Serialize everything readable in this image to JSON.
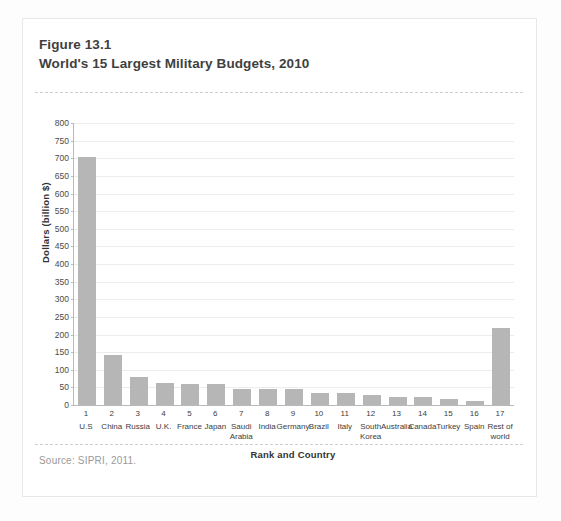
{
  "figure": {
    "number": "Figure 13.1",
    "title": "World's 15 Largest Military Budgets, 2010",
    "source": "Source: SIPRI, 2011."
  },
  "chart_data": {
    "type": "bar",
    "title": "World's 15 Largest Military Budgets, 2010",
    "xlabel": "Rank and Country",
    "ylabel": "Dollars (billion $)",
    "ylim": [
      0,
      800
    ],
    "ytick_step": 50,
    "yticks": [
      0,
      50,
      100,
      150,
      200,
      250,
      300,
      350,
      400,
      450,
      500,
      550,
      600,
      650,
      700,
      750,
      800
    ],
    "ytick_labels": [
      "0",
      "50",
      "100",
      "150",
      "200",
      "250",
      "300",
      "350",
      "400",
      "450",
      "500",
      "550",
      "600",
      "650",
      "700",
      "750",
      "800"
    ],
    "grid": true,
    "legend": null,
    "bar_color": "#b6b6b6",
    "ranks": [
      "1",
      "2",
      "3",
      "4",
      "5",
      "6",
      "7",
      "8",
      "9",
      "10",
      "11",
      "12",
      "13",
      "14",
      "15",
      "16",
      "17"
    ],
    "categories": [
      "U.S",
      "China",
      "Russia",
      "U.K.",
      "France",
      "Japan",
      "Saudi Arabia",
      "India",
      "Germany",
      "Brazil",
      "Italy",
      "South Korea",
      "Australia",
      "Canada",
      "Turkey",
      "Spain",
      "Rest of world"
    ],
    "values": [
      705,
      143,
      79,
      62,
      61,
      60,
      45,
      45,
      45,
      34,
      34,
      28,
      24,
      23,
      17,
      12,
      218
    ]
  }
}
